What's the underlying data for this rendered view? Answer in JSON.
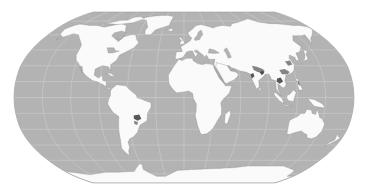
{
  "map": {
    "projection": "Robinson",
    "style": "grayscale",
    "colors": {
      "background": "#ffffff",
      "ocean": "#b3b3b3",
      "land": "#fafafa",
      "coast": "#8c8c8c",
      "graticule": "#d2d2d2",
      "hotspot_dark": "#3a3a3a",
      "hotspot_mid": "#6e6e6e"
    },
    "extent_px": {
      "left": 14,
      "right": 354,
      "top": 12,
      "bottom": 183,
      "top_flat_left": 88,
      "top_flat_right": 280
    },
    "graticule": {
      "lat_step_deg": 15,
      "lon_step_deg": 30
    },
    "continents": [
      "North America",
      "South America",
      "Europe",
      "Africa",
      "Asia",
      "Australia",
      "Antarctica",
      "Greenland"
    ],
    "hotspots": [
      {
        "region": "India (Ganges plain)",
        "intensity": "high"
      },
      {
        "region": "Southeast Asia / Southern China",
        "intensity": "medium"
      },
      {
        "region": "Southeastern Brazil",
        "intensity": "high"
      },
      {
        "region": "Eastern China",
        "intensity": "medium"
      }
    ]
  }
}
